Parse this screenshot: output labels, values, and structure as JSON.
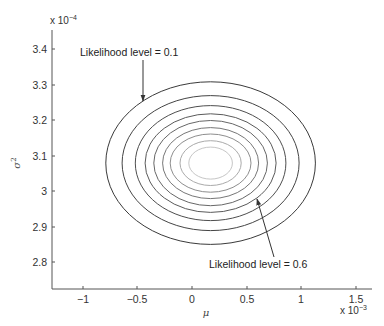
{
  "chart_data": {
    "type": "contour",
    "title": "",
    "xlabel": "μ",
    "ylabel": "σ²",
    "x_multiplier": "x 10",
    "x_multiplier_exp": "-3",
    "y_multiplier": "x 10",
    "y_multiplier_exp": "-4",
    "xlim": [
      -1.3,
      1.65
    ],
    "ylim": [
      2.73,
      3.45
    ],
    "x_ticks": [
      "-1",
      "-0.5",
      "0",
      "0.5",
      "1",
      "1.5"
    ],
    "x_tick_values": [
      -1,
      -0.5,
      0,
      0.5,
      1,
      1.5
    ],
    "y_ticks": [
      "2.8",
      "2.9",
      "3",
      "3.1",
      "3.2",
      "3.3",
      "3.4"
    ],
    "y_tick_values": [
      2.8,
      2.9,
      3.0,
      3.1,
      3.2,
      3.3,
      3.4
    ],
    "grid": false,
    "center": {
      "mu": 0.17,
      "sigma2": 3.08
    },
    "contour_levels": [
      0.1,
      0.2,
      0.3,
      0.4,
      0.5,
      0.6,
      0.7,
      0.8,
      0.9
    ],
    "contours": [
      {
        "level": 0.1,
        "mu_halfwidth": 0.96,
        "sigma2_halfheight": 0.229,
        "color": "#3a3a3a"
      },
      {
        "level": 0.2,
        "mu_halfwidth": 0.81,
        "sigma2_halfheight": 0.19,
        "color": "#444444"
      },
      {
        "level": 0.3,
        "mu_halfwidth": 0.69,
        "sigma2_halfheight": 0.162,
        "color": "#4e4e4e"
      },
      {
        "level": 0.4,
        "mu_halfwidth": 0.6,
        "sigma2_halfheight": 0.139,
        "color": "#5a5a5a"
      },
      {
        "level": 0.5,
        "mu_halfwidth": 0.52,
        "sigma2_halfheight": 0.12,
        "color": "#676767"
      },
      {
        "level": 0.6,
        "mu_halfwidth": 0.44,
        "sigma2_halfheight": 0.1,
        "color": "#777777"
      },
      {
        "level": 0.7,
        "mu_halfwidth": 0.37,
        "sigma2_halfheight": 0.082,
        "color": "#8e8e8e"
      },
      {
        "level": 0.8,
        "mu_halfwidth": 0.28,
        "sigma2_halfheight": 0.063,
        "color": "#aaaaaa"
      },
      {
        "level": 0.9,
        "mu_halfwidth": 0.2,
        "sigma2_halfheight": 0.045,
        "color": "#c6c6c6"
      }
    ],
    "annotations": [
      {
        "text": "Likelihood level = 0.1",
        "points_to_level": 0.1
      },
      {
        "text": "Likelihood level = 0.6",
        "points_to_level": 0.6
      }
    ]
  },
  "labels": {
    "annotation_top": "Likelihood level = 0.1",
    "annotation_bottom": "Likelihood level = 0.6",
    "xlabel": "μ",
    "ylabel_base": "σ",
    "ylabel_exp": "2",
    "x_mult_base": "x 10",
    "x_mult_exp": "−3",
    "y_mult_base": "x 10",
    "y_mult_exp": "−4",
    "x_ticks": [
      "−1",
      "−0.5",
      "0",
      "0.5",
      "1",
      "1.5"
    ],
    "y_ticks": [
      "3.4",
      "3.3",
      "3.2",
      "3.1",
      "3",
      "2.9",
      "2.8"
    ]
  },
  "colors": {
    "axis": "#555555",
    "text": "#333333",
    "arrow": "#333333"
  }
}
